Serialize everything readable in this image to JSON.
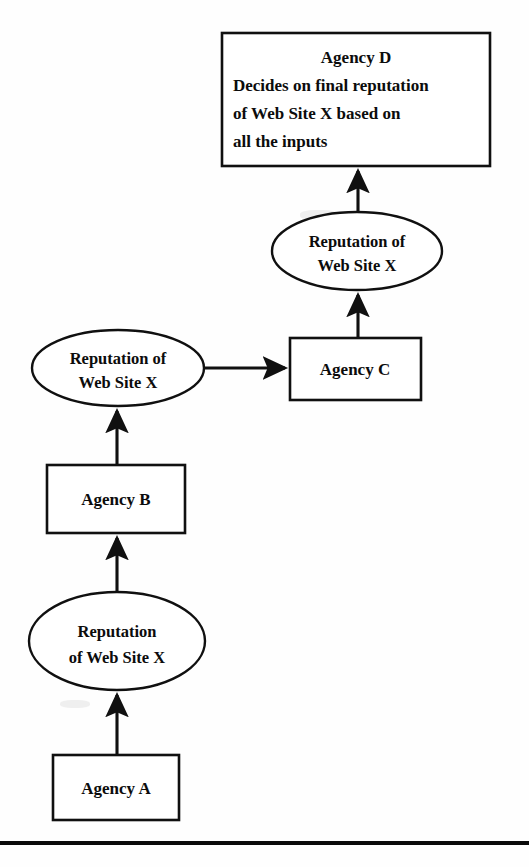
{
  "figure": {
    "type": "flow-diagram",
    "title_visible": false,
    "background_color": "#fefefe",
    "line_color": "#101010",
    "text_color": "#0c0c0c"
  },
  "nodes": {
    "agency_d": {
      "kind": "rectangle",
      "heading": "Agency D",
      "lines": [
        "Decides on final reputation",
        "of Web Site X based on",
        "all the inputs"
      ]
    },
    "reputation_top": {
      "kind": "ellipse",
      "lines": [
        "Reputation of",
        "Web Site X"
      ]
    },
    "agency_c": {
      "kind": "rectangle",
      "label": "Agency C"
    },
    "reputation_middle": {
      "kind": "ellipse",
      "lines": [
        "Reputation of",
        "Web Site X"
      ]
    },
    "agency_b": {
      "kind": "rectangle",
      "label": "Agency B"
    },
    "reputation_bottom": {
      "kind": "ellipse",
      "lines": [
        "Reputation",
        "of Web Site X"
      ]
    },
    "agency_a": {
      "kind": "rectangle",
      "label": "Agency A"
    }
  },
  "edges": [
    {
      "from": "agency_a",
      "to": "reputation_bottom",
      "direction": "up"
    },
    {
      "from": "reputation_bottom",
      "to": "agency_b",
      "direction": "up"
    },
    {
      "from": "agency_b",
      "to": "reputation_middle",
      "direction": "up"
    },
    {
      "from": "reputation_middle",
      "to": "agency_c",
      "direction": "right"
    },
    {
      "from": "agency_c",
      "to": "reputation_top",
      "direction": "up"
    },
    {
      "from": "reputation_top",
      "to": "agency_d",
      "direction": "up"
    }
  ],
  "footer_rule": {
    "present": true,
    "style": "solid-horizontal-rule"
  }
}
